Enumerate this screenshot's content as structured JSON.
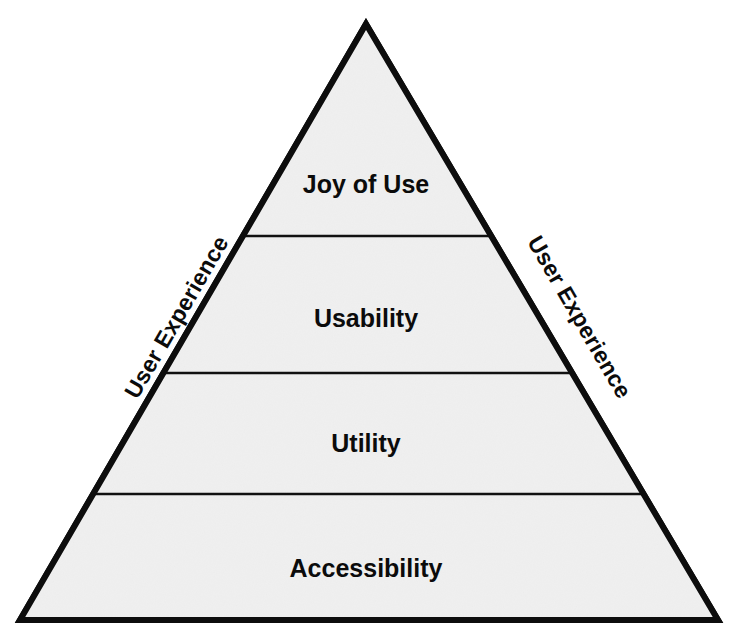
{
  "diagram": {
    "type": "pyramid",
    "fill_color": "#f0f0f0",
    "outline_color": "#0d0d0d",
    "text_color": "#0b0b0b",
    "background_color": "#ffffff",
    "tiers": [
      {
        "label": "Joy of Use",
        "level": 4,
        "position": "top",
        "font_size": 25,
        "center_x": 366,
        "center_y": 186
      },
      {
        "label": "Usability",
        "level": 3,
        "position": "upper-middle",
        "font_size": 25,
        "center_x": 366,
        "center_y": 320
      },
      {
        "label": "Utility",
        "level": 2,
        "position": "lower-middle",
        "font_size": 25,
        "center_x": 366,
        "center_y": 445
      },
      {
        "label": "Accessibility",
        "level": 1,
        "position": "base",
        "font_size": 25,
        "center_x": 366,
        "center_y": 570
      }
    ],
    "side_labels": [
      {
        "text": "User Experience",
        "side": "left",
        "rotation_deg": -59.9,
        "font_size": 23,
        "anchor_x": 178,
        "anchor_y": 318
      },
      {
        "text": "User Experience",
        "side": "right",
        "rotation_deg": 59.9,
        "font_size": 23,
        "anchor_x": 578,
        "anchor_y": 318
      }
    ],
    "geometry": {
      "apex_x": 366,
      "apex_y": 24,
      "base_left_x": 20,
      "base_right_x": 718,
      "base_y": 620,
      "divider_y_values": [
        236,
        373,
        494
      ]
    }
  }
}
